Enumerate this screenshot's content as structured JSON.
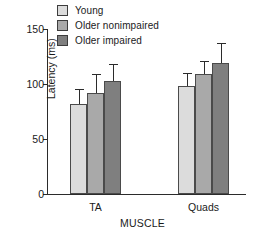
{
  "chart_data": {
    "type": "bar",
    "title": "",
    "xlabel": "MUSCLE",
    "ylabel": "Latency (ms)",
    "categories": [
      "TA",
      "Quads"
    ],
    "ylim": [
      0,
      150
    ],
    "yticks": [
      0,
      50,
      100,
      150
    ],
    "ytick_labels": [
      "0",
      "50",
      "100",
      "150"
    ],
    "grid": false,
    "legend_position": "top-left",
    "series": [
      {
        "name": "Young",
        "color": "#dcdcdc",
        "values": [
          82,
          98
        ],
        "errors": [
          13,
          11
        ]
      },
      {
        "name": "Older nonimpaired",
        "color": "#a9a9a9",
        "values": [
          92,
          109
        ],
        "errors": [
          16,
          11
        ]
      },
      {
        "name": "Older impaired",
        "color": "#7f7f7f",
        "values": [
          103,
          119
        ],
        "errors": [
          14,
          17
        ]
      }
    ]
  },
  "legend": {
    "items": [
      {
        "label": "Young",
        "color": "#dcdcdc"
      },
      {
        "label": "Older nonimpaired",
        "color": "#a9a9a9"
      },
      {
        "label": "Older impaired",
        "color": "#7f7f7f"
      }
    ]
  },
  "axes": {
    "y_title": "Latency (ms)",
    "x_title": "MUSCLE",
    "y_tick_0": "0",
    "y_tick_1": "50",
    "y_tick_2": "100",
    "y_tick_3": "150",
    "x_cat_0": "TA",
    "x_cat_1": "Quads"
  },
  "colors": {
    "axis": "#2b2b2b",
    "bar_edge": "#4a4a4a",
    "background": "#ffffff"
  }
}
